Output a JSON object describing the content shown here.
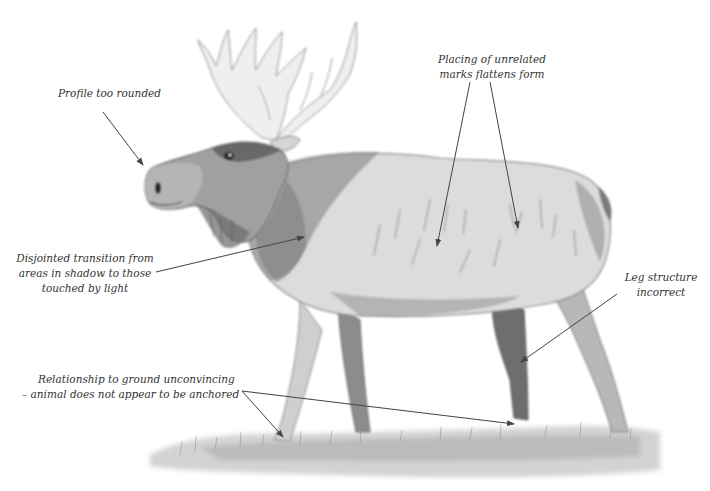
{
  "figure": {
    "colors": {
      "background": "#ffffff",
      "ink": "#333333",
      "arrow": "#444444",
      "fur_dark": "#5a5a5a",
      "fur_mid": "#9a9a9a",
      "fur_light": "#d8d8d8",
      "antler": "#eeeeee",
      "grass": "#b8b8b8"
    }
  },
  "annotations": [
    {
      "id": "profile",
      "lines": [
        "Profile too rounded"
      ],
      "target": "muzzle"
    },
    {
      "id": "marks",
      "lines": [
        "Placing of unrelated",
        "marks flattens form"
      ],
      "target": "body flank (two arrows)"
    },
    {
      "id": "transition",
      "lines": [
        "Disjointed transition from",
        "areas in shadow to those",
        "touched by light"
      ],
      "target": "shoulder"
    },
    {
      "id": "leg",
      "lines": [
        "Leg structure",
        "incorrect"
      ],
      "target": "hind leg"
    },
    {
      "id": "ground",
      "lines": [
        "Relationship to ground unconvincing",
        "– animal does not appear to be anchored"
      ],
      "target": "hooves (two arrows)"
    }
  ]
}
